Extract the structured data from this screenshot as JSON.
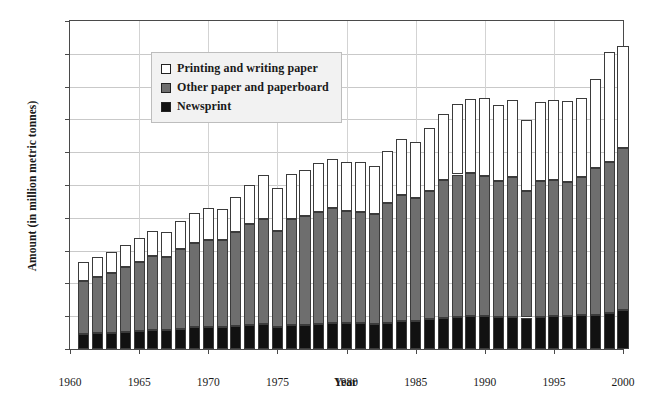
{
  "chart_data": {
    "type": "bar",
    "stacked": true,
    "title": "",
    "xlabel": "Year",
    "ylabel": "Amount (in million metric tonnes)",
    "xlim": [
      1960,
      2000
    ],
    "ylim": [
      0,
      100
    ],
    "ytick_step": 10,
    "yticks": [
      0,
      10,
      20,
      30,
      40,
      50,
      60,
      70,
      80,
      90,
      100
    ],
    "xticks": [
      1960,
      1965,
      1970,
      1975,
      1980,
      1985,
      1990,
      1995,
      2000
    ],
    "grid": "horizontal-and-vertical",
    "legend_position": "top-left-inside",
    "categories": [
      1961,
      1962,
      1963,
      1964,
      1965,
      1966,
      1967,
      1968,
      1969,
      1970,
      1971,
      1972,
      1973,
      1974,
      1975,
      1976,
      1977,
      1978,
      1979,
      1980,
      1981,
      1982,
      1983,
      1984,
      1985,
      1986,
      1987,
      1988,
      1989,
      1990,
      1991,
      1992,
      1993,
      1994,
      1995,
      1996,
      1997,
      1998,
      1999,
      2000
    ],
    "series": [
      {
        "name": "Newsprint",
        "color": "#111111",
        "values": [
          4.6,
          4.8,
          5.0,
          5.2,
          5.5,
          5.8,
          5.8,
          6.2,
          6.6,
          6.8,
          6.7,
          7.0,
          7.4,
          7.5,
          6.6,
          7.2,
          7.4,
          7.6,
          8.0,
          8.0,
          8.0,
          7.7,
          8.0,
          8.4,
          8.6,
          9.0,
          9.4,
          9.8,
          10.0,
          10.0,
          9.7,
          9.7,
          9.6,
          9.9,
          10.2,
          10.1,
          10.4,
          10.5,
          11.0,
          11.8
        ]
      },
      {
        "name": "Other paper and paperboard",
        "color": "#6e6e6e",
        "values": [
          16.2,
          17.0,
          18.3,
          19.7,
          20.9,
          22.5,
          22.2,
          24.4,
          25.7,
          26.5,
          26.5,
          28.7,
          30.8,
          32.2,
          29.5,
          32.5,
          33.1,
          34.3,
          35.0,
          34.2,
          33.9,
          33.6,
          36.6,
          38.6,
          37.5,
          39.3,
          42.2,
          43.4,
          43.7,
          42.7,
          41.5,
          42.8,
          38.6,
          41.2,
          41.2,
          40.8,
          42.0,
          44.6,
          46.0,
          49.5
        ]
      },
      {
        "name": "Printing and writing paper",
        "color": "#ffffff",
        "values": [
          5.8,
          6.2,
          6.4,
          6.8,
          7.3,
          7.8,
          7.8,
          8.4,
          9.1,
          9.6,
          9.6,
          10.6,
          11.7,
          13.3,
          12.9,
          13.7,
          14.2,
          14.8,
          15.0,
          14.8,
          15.0,
          14.5,
          15.7,
          17.1,
          16.9,
          19.0,
          20.1,
          21.5,
          22.5,
          23.8,
          23.3,
          23.5,
          21.6,
          24.1,
          24.6,
          24.7,
          24.2,
          27.2,
          33.5,
          31.0
        ]
      }
    ]
  },
  "legend": {
    "items": [
      {
        "label": "Printing and writing paper",
        "swatch": "sw-printing"
      },
      {
        "label": "Other paper and paperboard",
        "swatch": "sw-other"
      },
      {
        "label": "Newsprint",
        "swatch": "sw-newsprint"
      }
    ]
  }
}
